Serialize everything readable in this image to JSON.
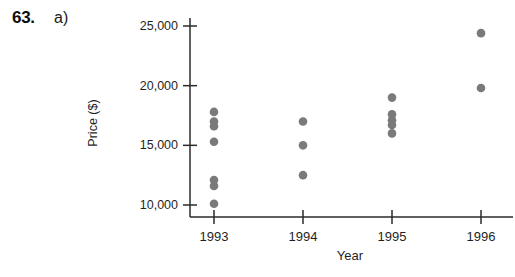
{
  "problem": {
    "number": "63.",
    "part": "a)"
  },
  "chart_data": {
    "type": "scatter",
    "title": "",
    "xlabel": "Year",
    "ylabel": "Price ($)",
    "x": [
      1993,
      1994,
      1995,
      1996
    ],
    "xtick_labels": [
      "1993",
      "1994",
      "1995",
      "1996"
    ],
    "ytick_labels": [
      "10,000",
      "15,000",
      "20,000",
      "25,000"
    ],
    "yticks": [
      10000,
      15000,
      20000,
      25000
    ],
    "ylim": [
      9000,
      25800
    ],
    "xlim": [
      1992.55,
      1996.45
    ],
    "grid": false,
    "legend": null,
    "marker": "filled-circle",
    "marker_color": "#7a7a7a",
    "axis_color": "#2b2b2b",
    "series": [
      {
        "name": "Price",
        "points": [
          {
            "x": 1993,
            "y": 17800
          },
          {
            "x": 1993,
            "y": 17000
          },
          {
            "x": 1993,
            "y": 16600
          },
          {
            "x": 1993,
            "y": 15300
          },
          {
            "x": 1993,
            "y": 12100
          },
          {
            "x": 1993,
            "y": 11600
          },
          {
            "x": 1993,
            "y": 10100
          },
          {
            "x": 1994,
            "y": 17000
          },
          {
            "x": 1994,
            "y": 15000
          },
          {
            "x": 1994,
            "y": 12500
          },
          {
            "x": 1995,
            "y": 19000
          },
          {
            "x": 1995,
            "y": 17600
          },
          {
            "x": 1995,
            "y": 17100
          },
          {
            "x": 1995,
            "y": 16700
          },
          {
            "x": 1995,
            "y": 16000
          },
          {
            "x": 1996,
            "y": 24400
          },
          {
            "x": 1996,
            "y": 19800
          }
        ]
      }
    ]
  },
  "geometry": {
    "plot_left": 214,
    "plot_right": 505,
    "axis_x_line_start": 190,
    "axis_y_top": 18,
    "axis_y_bottom": 217,
    "y_pixel_10000": 205,
    "y_pixel_25000": 26,
    "x_pixel_1993": 214,
    "x_pixel_step": 89,
    "y_axis_x": 190,
    "tick_len": 7,
    "marker_radius": 4.3
  }
}
